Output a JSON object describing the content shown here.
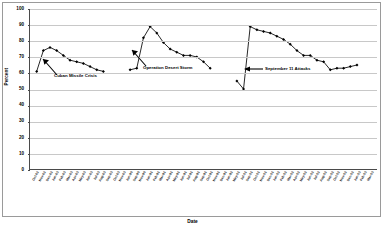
{
  "chart_data": {
    "type": "line",
    "title": "",
    "xlabel": "Date",
    "ylabel": "Percent",
    "ylim": [
      0,
      100
    ],
    "ytick_step": 10,
    "yticks": [
      100,
      90,
      80,
      70,
      60,
      50,
      40,
      30,
      20,
      10,
      0
    ],
    "grid": true,
    "legend": "none",
    "marker": "filled-diamond",
    "line_color": "#000000",
    "categories": [
      "Oct-62",
      "Nov-62",
      "Dec-62",
      "Jan-63",
      "Feb-63",
      "Mar-63",
      "Apr-63",
      "May-63",
      "Jun-63",
      "Jul-63",
      "Aug-63",
      "Sep-63",
      "Oct-63",
      "Nov-63",
      "Jun-90",
      "Sep-90",
      "Nov-90",
      "Jan-91",
      "Feb-91",
      "Mar-91",
      "Apr-91",
      "May-91",
      "Jun-91",
      "Jul-91",
      "Aug-91",
      "Sep-91",
      "Oct-91",
      "Nov-91",
      "Dec-91",
      "Jan-92",
      "May-01",
      "Jul-01",
      "Sep-01",
      "Oct-01",
      "Nov-01",
      "Dec-01",
      "Jan-02",
      "Feb-02",
      "Mar-02",
      "Apr-02",
      "May-02",
      "Jun-02",
      "Jul-02",
      "Aug-02",
      "Sep-02",
      "Oct-02",
      "Nov-02",
      "Dec-02",
      "Jan-03",
      "Feb-03",
      "Mar-03"
    ],
    "series": [
      {
        "name": "Trust in Government",
        "segments": [
          {
            "label": "Cuban Missile Crisis era",
            "points": [
              {
                "x": "Oct-62",
                "y": 61
              },
              {
                "x": "Nov-62",
                "y": 74
              },
              {
                "x": "Dec-62",
                "y": 76
              },
              {
                "x": "Jan-63",
                "y": 74
              },
              {
                "x": "Feb-63",
                "y": 71
              },
              {
                "x": "Mar-63",
                "y": 68
              },
              {
                "x": "Apr-63",
                "y": 67
              },
              {
                "x": "May-63",
                "y": 66
              },
              {
                "x": "Jun-63",
                "y": 64
              },
              {
                "x": "Jul-63",
                "y": 62
              },
              {
                "x": "Aug-63",
                "y": 61
              }
            ]
          },
          {
            "label": "Operation Desert Storm era",
            "points": [
              {
                "x": "Jun-90",
                "y": 62
              },
              {
                "x": "Sep-90",
                "y": 63
              },
              {
                "x": "Nov-90",
                "y": 82
              },
              {
                "x": "Jan-91",
                "y": 89
              },
              {
                "x": "Feb-91",
                "y": 85
              },
              {
                "x": "Mar-91",
                "y": 79
              },
              {
                "x": "Apr-91",
                "y": 75
              },
              {
                "x": "May-91",
                "y": 73
              },
              {
                "x": "Jun-91",
                "y": 71
              },
              {
                "x": "Jul-91",
                "y": 71
              },
              {
                "x": "Aug-91",
                "y": 70
              },
              {
                "x": "Sep-91",
                "y": 67
              },
              {
                "x": "Oct-91",
                "y": 63
              }
            ]
          },
          {
            "label": "September 11 Attacks era",
            "points": [
              {
                "x": "May-01",
                "y": 55
              },
              {
                "x": "Jul-01",
                "y": 50
              },
              {
                "x": "Sep-01",
                "y": 89
              },
              {
                "x": "Oct-01",
                "y": 87
              },
              {
                "x": "Nov-01",
                "y": 86
              },
              {
                "x": "Dec-01",
                "y": 85
              },
              {
                "x": "Jan-02",
                "y": 83
              },
              {
                "x": "Feb-02",
                "y": 81
              },
              {
                "x": "Mar-02",
                "y": 78
              },
              {
                "x": "Apr-02",
                "y": 74
              },
              {
                "x": "May-02",
                "y": 71
              },
              {
                "x": "Jun-02",
                "y": 71
              },
              {
                "x": "Jul-02",
                "y": 68
              },
              {
                "x": "Aug-02",
                "y": 67
              },
              {
                "x": "Sep-02",
                "y": 62
              },
              {
                "x": "Oct-02",
                "y": 63
              },
              {
                "x": "Nov-02",
                "y": 63
              },
              {
                "x": "Dec-02",
                "y": 64
              },
              {
                "x": "Jan-03",
                "y": 65
              }
            ]
          }
        ]
      }
    ],
    "annotations": [
      {
        "text": "Cuban Missile Crisis",
        "arrow": "up-left"
      },
      {
        "text": "Operation Desert Storm",
        "arrow": "up-left"
      },
      {
        "text": "September 11 Attacks",
        "arrow": "left"
      }
    ]
  }
}
